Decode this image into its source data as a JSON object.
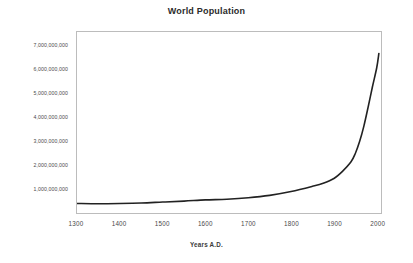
{
  "chart_data": {
    "type": "line",
    "title": "World Population",
    "xlabel": "Years A.D.",
    "ylabel": "",
    "xlim": [
      1300,
      2010
    ],
    "ylim": [
      0,
      7600000000
    ],
    "grid": false,
    "legend": null,
    "x_ticks": [
      "1300",
      "1400",
      "1500",
      "1600",
      "1700",
      "1800",
      "1900",
      "2000"
    ],
    "x_tick_values": [
      1300,
      1400,
      1500,
      1600,
      1700,
      1800,
      1900,
      2000
    ],
    "y_ticks": [
      "7,000,000,000",
      "6,000,000,000",
      "5,000,000,000",
      "4,000,000,000",
      "3,000,000,000",
      "2,000,000,000",
      "1,000,000,000"
    ],
    "y_tick_values": [
      7000000000,
      6000000000,
      5000000000,
      4000000000,
      3000000000,
      2000000000,
      1000000000
    ],
    "line_color": "#222222",
    "line_width": 1.6,
    "series": [
      {
        "name": "World Population",
        "x": [
          1300,
          1350,
          1400,
          1450,
          1500,
          1550,
          1600,
          1650,
          1700,
          1750,
          1800,
          1850,
          1875,
          1900,
          1920,
          1940,
          1950,
          1960,
          1970,
          1980,
          1990,
          2000,
          2005
        ],
        "values": [
          400000000,
          390000000,
          400000000,
          420000000,
          460000000,
          500000000,
          550000000,
          580000000,
          640000000,
          740000000,
          900000000,
          1120000000,
          1250000000,
          1450000000,
          1750000000,
          2150000000,
          2500000000,
          3000000000,
          3650000000,
          4450000000,
          5300000000,
          6100000000,
          6700000000
        ]
      }
    ]
  }
}
